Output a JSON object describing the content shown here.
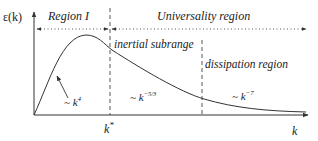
{
  "diagram": {
    "type": "energy-spectrum-sketch",
    "y_axis_label": "ε(k)",
    "x_axis_label": "k",
    "k_star_label": "k",
    "k_star_sup": "*",
    "regions": [
      {
        "label": "Region I"
      },
      {
        "label": "Universality region"
      },
      {
        "label": "inertial subrange"
      },
      {
        "label": "dissipation region"
      }
    ],
    "scalings": [
      {
        "prefix": "~ k",
        "exponent": "4"
      },
      {
        "prefix": "~ k",
        "exponent": "−5/3"
      },
      {
        "prefix": "~ k",
        "exponent": "−7"
      }
    ],
    "colors": {
      "line": "#333333",
      "text": "#222222",
      "background": "#ffffff"
    }
  }
}
